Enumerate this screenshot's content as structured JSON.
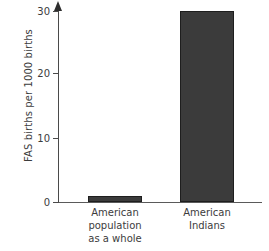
{
  "chart_data": {
    "type": "bar",
    "title": "",
    "subtitle": "",
    "xlabel": "",
    "ylabel": "FAS births per 1000 births",
    "categories": [
      "American population as a whole",
      "American Indians"
    ],
    "category_lines": [
      [
        "American",
        "population",
        "as a whole"
      ],
      [
        "American",
        "Indians"
      ]
    ],
    "values": [
      1,
      30
    ],
    "ylim": [
      0,
      30
    ],
    "yticks": [
      0,
      10,
      20,
      30
    ],
    "ytick_labels": [
      "0",
      "10",
      "20",
      "30"
    ],
    "grid": false,
    "legend": null,
    "legend_position": "none",
    "bar_color": "#3b3b3b",
    "bar_edge_color": "#1e1e1e",
    "axis_color": "#4a4a4a",
    "text_color": "#3c3c3c",
    "background": "#ffffff"
  }
}
